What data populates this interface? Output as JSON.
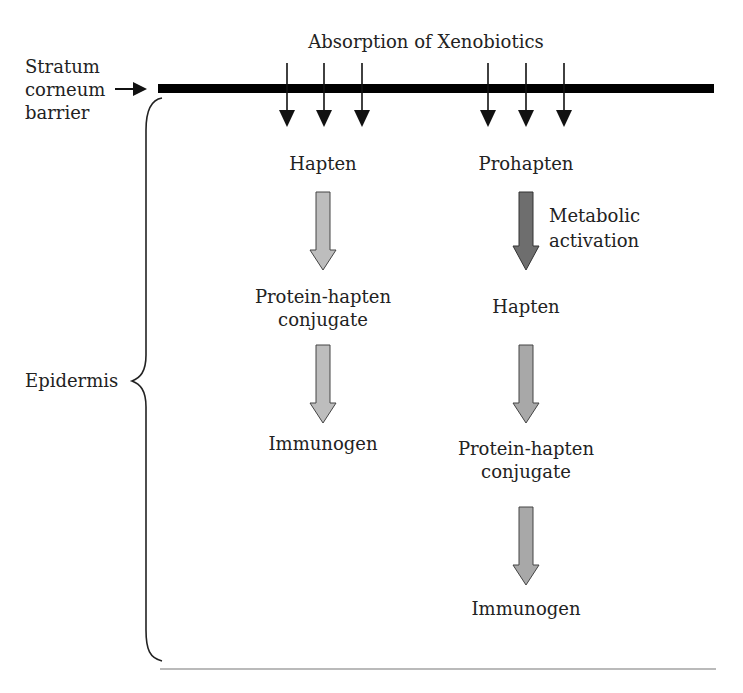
{
  "title": "Absorption of Xenobiotics",
  "barrier_label": [
    "Stratum",
    "corneum",
    "barrier"
  ],
  "region_label": "Epidermis",
  "left_pathway": {
    "steps": [
      "Hapten",
      "Protein-hapten",
      "conjugate",
      "Immunogen"
    ]
  },
  "right_pathway": {
    "steps": [
      "Prohapten",
      "Hapten",
      "Protein-hapten",
      "conjugate",
      "Immunogen"
    ],
    "activation_label": [
      "Metabolic",
      "activation"
    ]
  },
  "colors": {
    "barrier": "#000000",
    "light_arrow_fill": "#bdbdbd",
    "dark_arrow_fill": "#6e6e6e",
    "outline": "#333333"
  }
}
